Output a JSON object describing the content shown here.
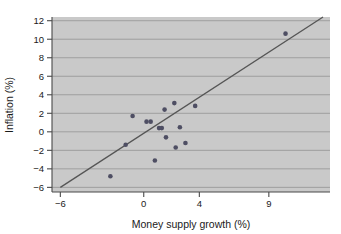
{
  "chart_data": {
    "type": "scatter",
    "title": "",
    "xlabel": "Money supply growth (%)",
    "ylabel": "Inflation (%)",
    "xlim": [
      -6.6,
      13.4
    ],
    "ylim": [
      -6.5,
      12.4
    ],
    "xticks": [
      -6,
      0,
      4,
      9
    ],
    "xtick_labels": [
      "−6",
      "0",
      "4",
      "9"
    ],
    "yticks": [
      -6,
      -4,
      -2,
      0,
      2,
      4,
      6,
      8,
      10,
      12
    ],
    "ytick_labels": [
      "−6",
      "−4",
      "−2",
      "0",
      "2",
      "4",
      "6",
      "8",
      "10",
      "12"
    ],
    "grid": true,
    "grid_axis": "y",
    "legend": null,
    "plot_bgcolor": "#c9c9c9",
    "point_color": "#4e4e63",
    "line_color": "#555555",
    "points": [
      {
        "x": -2.4,
        "y": -4.8
      },
      {
        "x": -1.3,
        "y": -1.4
      },
      {
        "x": -0.8,
        "y": 1.7
      },
      {
        "x": 0.2,
        "y": 1.1
      },
      {
        "x": 0.5,
        "y": 1.1
      },
      {
        "x": 0.8,
        "y": -3.1
      },
      {
        "x": 1.1,
        "y": 0.4
      },
      {
        "x": 1.3,
        "y": 0.4
      },
      {
        "x": 1.5,
        "y": 2.4
      },
      {
        "x": 1.6,
        "y": -0.6
      },
      {
        "x": 2.2,
        "y": 3.1
      },
      {
        "x": 2.3,
        "y": -1.7
      },
      {
        "x": 2.6,
        "y": 0.5
      },
      {
        "x": 3.0,
        "y": -1.2
      },
      {
        "x": 3.7,
        "y": 2.8
      },
      {
        "x": 10.2,
        "y": 10.6
      }
    ],
    "trend_line": {
      "type": "linear-fit",
      "x_start": -6.0,
      "y_start": -6.0,
      "x_end": 12.9,
      "y_end": 12.4
    }
  },
  "axis_titles": {
    "x": "Money supply growth (%)",
    "y": "Inflation (%)"
  }
}
